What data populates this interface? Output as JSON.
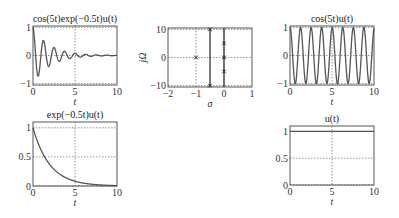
{
  "chart_data": [
    {
      "id": "p1",
      "type": "line",
      "title": "cos(5t)exp(−0.5t)u(t)",
      "xlabel": "t",
      "ylabel": "",
      "xlim": [
        0,
        10
      ],
      "ylim": [
        -1.05,
        1.05
      ],
      "xticks": [
        0,
        5,
        10
      ],
      "yticks": [
        -1,
        0,
        1
      ],
      "grid": true,
      "formula": "cos5t_exp",
      "series": [
        {
          "name": "cos(5t)exp(-0.5t)u(t)",
          "x_range": [
            0,
            10
          ],
          "description": "damped cosine, freq 5 rad/s, decay 0.5"
        }
      ],
      "box": [
        33,
        26,
        117,
        85
      ]
    },
    {
      "id": "p2",
      "type": "scatter",
      "title": "",
      "xlabel": "σ",
      "ylabel": "jΩ",
      "xlim": [
        -2,
        1
      ],
      "ylim": [
        -10.5,
        10.5
      ],
      "xticks": [
        -2,
        -1,
        0,
        1
      ],
      "yticks": [
        -10,
        0,
        10
      ],
      "grid": true,
      "vertical_lines": [
        -0.5,
        0
      ],
      "poles": [
        {
          "x": -1,
          "y": 0
        },
        {
          "x": -0.5,
          "y": 10
        },
        {
          "x": -0.5,
          "y": -10
        },
        {
          "x": 0,
          "y": 5
        },
        {
          "x": 0,
          "y": -5
        },
        {
          "x": 0,
          "y": 0
        }
      ],
      "box": [
        168,
        28,
        252,
        87
      ]
    },
    {
      "id": "p3",
      "type": "line",
      "title": "cos(5t)u(t)",
      "xlabel": "t",
      "ylabel": "",
      "xlim": [
        0,
        10
      ],
      "ylim": [
        -1.05,
        1.05
      ],
      "xticks": [
        0,
        5,
        10
      ],
      "yticks": [
        -1,
        0,
        1
      ],
      "grid": true,
      "formula": "cos5t",
      "series": [
        {
          "name": "cos(5t)u(t)",
          "x_range": [
            0,
            10
          ]
        }
      ],
      "box": [
        290,
        26,
        374,
        85
      ]
    },
    {
      "id": "p4",
      "type": "line",
      "title": "exp(−0.5t)u(t)",
      "xlabel": "t",
      "ylabel": "",
      "xlim": [
        0,
        10
      ],
      "ylim": [
        0,
        1.1
      ],
      "xticks": [
        0,
        5,
        10
      ],
      "yticks": [
        0,
        0.5,
        1
      ],
      "grid": true,
      "formula": "exp",
      "series": [
        {
          "name": "exp(-0.5t)u(t)",
          "x": [
            0,
            1,
            2,
            3,
            4,
            5,
            6,
            8,
            10
          ],
          "values": [
            1,
            0.61,
            0.37,
            0.22,
            0.14,
            0.08,
            0.05,
            0.02,
            0.007
          ]
        }
      ],
      "box": [
        33,
        122,
        117,
        186
      ]
    },
    {
      "id": "p5",
      "type": "line",
      "title": "u(t)",
      "xlabel": "t",
      "ylabel": "",
      "xlim": [
        0,
        10
      ],
      "ylim": [
        0,
        1.1
      ],
      "xticks": [
        0,
        5,
        10
      ],
      "yticks": [
        0,
        0.5,
        1
      ],
      "grid": true,
      "formula": "step",
      "series": [
        {
          "name": "u(t)",
          "x": [
            0,
            10
          ],
          "values": [
            1,
            1
          ]
        }
      ],
      "box": [
        290,
        126,
        374,
        185
      ]
    }
  ],
  "colors": {
    "curve": "#555555",
    "axis": "#444444",
    "grid": "#666666"
  }
}
